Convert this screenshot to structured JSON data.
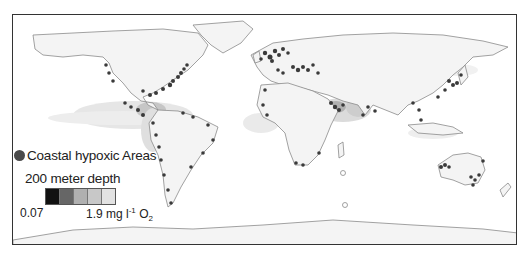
{
  "map": {
    "title": "",
    "projection": "equirectangular world map",
    "colors": {
      "land": "#f4f4f4",
      "coastline": "#8a8a8a",
      "hypoxic_dot": "#3a3a3a",
      "frame": "#333333"
    }
  },
  "legend": {
    "hypoxic_label": "Coastal hypoxic Areas",
    "depth_title": "200 meter depth",
    "scale_min": "0.07",
    "scale_max_value": "1.9 mg l",
    "scale_max_exp": "-1",
    "scale_max_unit": " O",
    "scale_max_sub": "2",
    "swatch_colors": [
      "#111111",
      "#666666",
      "#b0b0b0",
      "#c8c8c8",
      "#e2e2e2"
    ]
  }
}
